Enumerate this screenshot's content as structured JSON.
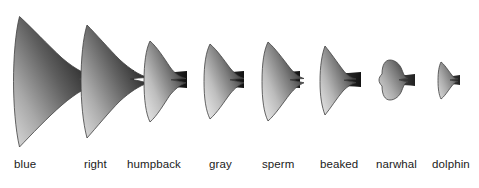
{
  "figure": {
    "background_color": "#ffffff",
    "outline_color": "#4a4a4a",
    "label_color": "#1b1b1b",
    "orientation": "flukes face left, peduncle stems to the right",
    "ordering": "largest to smallest, left to right"
  },
  "species": [
    {
      "label": "blue",
      "label_x": 14,
      "label_y": 158,
      "shade_light": "#b9b9b9",
      "shade_dark": "#1c1c1c",
      "stem_color": "#101010",
      "relative_size": 1.0,
      "fluke_path": "M22,17 C41,35 59,58 72,74 L70,78 C58,72 47,70 38,73 C50,80 58,86 64,93 C60,110 48,129 33,146 C25,124 20,99 20,78 C20,54 20,33 22,17 Z",
      "transform": "translate(0,0) scale(1,1)",
      "body_path": "M22,17 C45,36 66,60 80,75 C92,77 100,74 108,73 L108,86 C100,85 92,82 80,83 C66,99 45,126 33,147 C24,123 19,100 19,79 C19,55 20,33 22,17 Z",
      "stem_path": "M100,70 L113,70 L113,89 L100,89 C104,85 104,74 100,70 Z"
    },
    {
      "label": "right",
      "label_x": 84,
      "label_y": 158,
      "shade_light": "#c4c4c4",
      "shade_dark": "#222222",
      "stem_color": "#101010",
      "relative_size": 0.86
    },
    {
      "label": "humpback",
      "label_x": 127,
      "label_y": 158,
      "shade_light": "#dcdcdc",
      "shade_dark": "#3a3a3a",
      "stem_color": "#1a1a1a",
      "relative_size": 0.63
    },
    {
      "label": "gray",
      "label_x": 209,
      "label_y": 158,
      "shade_light": "#dedede",
      "shade_dark": "#3d3d3d",
      "stem_color": "#1a1a1a",
      "relative_size": 0.59
    },
    {
      "label": "sperm",
      "label_x": 262,
      "label_y": 158,
      "shade_light": "#dedede",
      "shade_dark": "#3a3a3a",
      "stem_color": "#181818",
      "relative_size": 0.62
    },
    {
      "label": "beaked",
      "label_x": 320,
      "label_y": 158,
      "shade_light": "#d9d9d9",
      "shade_dark": "#3f3f3f",
      "stem_color": "#1c1c1c",
      "relative_size": 0.54
    },
    {
      "label": "narwhal",
      "label_x": 376,
      "label_y": 158,
      "shade_light": "#c9c9c9",
      "shade_dark": "#4a4a4a",
      "stem_color": "#222222",
      "relative_size": 0.24
    },
    {
      "label": "dolphin",
      "label_x": 432,
      "label_y": 158,
      "shade_light": "#cacaca",
      "shade_dark": "#484848",
      "stem_color": "#222222",
      "relative_size": 0.17
    }
  ]
}
